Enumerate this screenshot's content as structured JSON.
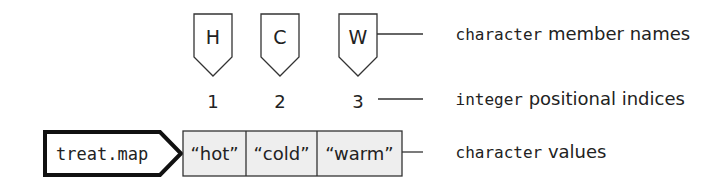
{
  "diagram": {
    "vector_name": "treat.map",
    "names": [
      "H",
      "C",
      "W"
    ],
    "indices": [
      "1",
      "2",
      "3"
    ],
    "values": [
      "“hot”",
      "“cold”",
      "“warm”"
    ],
    "annotations": {
      "names": {
        "type_word": "character",
        "rest": " member names"
      },
      "indices": {
        "type_word": "integer",
        "rest": " positional indices"
      },
      "values": {
        "type_word": "character",
        "rest": " values"
      }
    },
    "colors": {
      "stroke": "#333333",
      "cell_fill": "#eeeeee",
      "text": "#222222"
    }
  }
}
